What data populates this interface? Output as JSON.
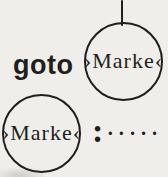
{
  "colors": {
    "background": "#f0eeea",
    "ink": "#211f1d"
  },
  "diagram": {
    "statement": {
      "keyword": "goto",
      "operand": "›Marke‹"
    },
    "definition": {
      "label": "›Marke‹",
      "colon": ":",
      "dots": "·····"
    }
  }
}
